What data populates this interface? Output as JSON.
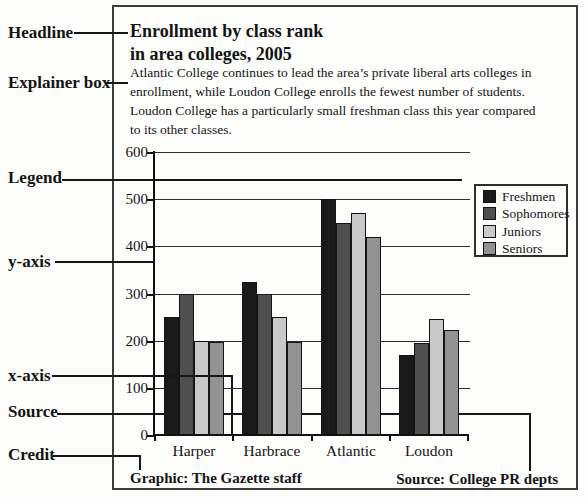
{
  "figure": {
    "headline": {
      "lines": [
        "Enrollment by class rank",
        "in area colleges, 2005"
      ]
    },
    "explainer": {
      "lines": [
        "Atlantic College continues to lead the area’s private liberal arts colleges in",
        "enrollment, while Loudon College enrolls the fewest number of students.",
        "Loudon College has a particularly small freshman class this year compared",
        "to its other classes."
      ]
    },
    "credit": "Graphic: The Gazette staff",
    "source": "Source: College PR depts"
  },
  "annotations": {
    "items": [
      {
        "id": "headline",
        "label": "Headline"
      },
      {
        "id": "explainer-box",
        "label": "Explainer box"
      },
      {
        "id": "legend",
        "label": "Legend"
      },
      {
        "id": "y-axis",
        "label": "y-axis"
      },
      {
        "id": "x-axis",
        "label": "x-axis"
      },
      {
        "id": "source",
        "label": "Source"
      },
      {
        "id": "credit",
        "label": "Credit"
      }
    ]
  },
  "chart_data": {
    "type": "bar",
    "title": "Enrollment by class rank in area colleges, 2005",
    "categories": [
      "Harper",
      "Harbrace",
      "Atlantic",
      "Loudon"
    ],
    "series": [
      {
        "name": "Freshmen",
        "color": "#1a1a1a",
        "values": [
          250,
          325,
          500,
          170
        ]
      },
      {
        "name": "Sophomores",
        "color": "#4f4f4f",
        "values": [
          300,
          300,
          450,
          195
        ]
      },
      {
        "name": "Juniors",
        "color": "#c9c9c9",
        "values": [
          200,
          250,
          470,
          245
        ]
      },
      {
        "name": "Seniors",
        "color": "#929292",
        "values": [
          197,
          198,
          420,
          222
        ]
      }
    ],
    "xlabel": "",
    "ylabel": "",
    "ylim": [
      0,
      600
    ],
    "yticks": [
      0,
      100,
      200,
      300,
      400,
      500,
      600
    ],
    "grid": true,
    "legend_position": "upper right",
    "credit": "Graphic: The Gazette staff",
    "source": "Source: College PR depts"
  }
}
